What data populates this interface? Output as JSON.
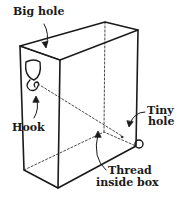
{
  "diagram": {
    "labels": {
      "big_hole": "Big hole",
      "hook": "Hook",
      "tiny_hole_line1": "Tiny",
      "tiny_hole_line2": "hole",
      "thread_line1": "Thread",
      "thread_line2": "inside box"
    },
    "colors": {
      "ink": "#1a1a1a",
      "background": "#ffffff"
    }
  }
}
